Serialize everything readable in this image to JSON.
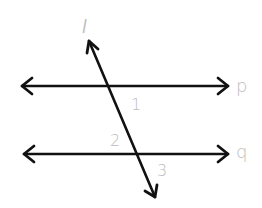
{
  "diagram": {
    "lines": [
      {
        "id": "l",
        "label": "l",
        "x1": 88,
        "y1": 40,
        "x2": 155,
        "y2": 198,
        "type": "transversal"
      },
      {
        "id": "p",
        "label": "p",
        "x1": 21,
        "y1": 86,
        "x2": 229,
        "y2": 86,
        "type": "parallel"
      },
      {
        "id": "q",
        "label": "q",
        "x1": 23,
        "y1": 154,
        "x2": 229,
        "y2": 154,
        "type": "parallel"
      }
    ],
    "line_labels": {
      "l": "l",
      "p": "p",
      "q": "q"
    },
    "angle_labels": {
      "a1": "1",
      "a2": "2",
      "a3": "3"
    },
    "colors": {
      "line": "#111111",
      "label": "#bdbdbd",
      "background": "#ffffff"
    }
  }
}
